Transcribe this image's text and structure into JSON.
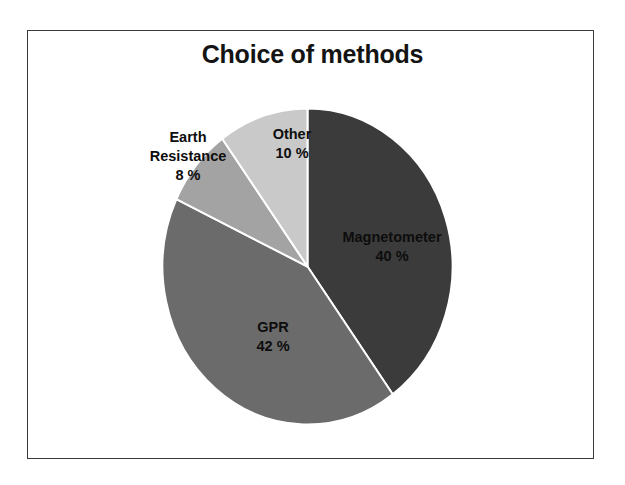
{
  "figure": {
    "title": "Choice of methods",
    "background_color": "#ffffff",
    "border_color": "#3a3a3a",
    "label_text_color": "#0d0d0d"
  },
  "chart_data": {
    "type": "pie",
    "title": "Choice of methods",
    "xlabel": "",
    "ylabel": "",
    "unit": "%",
    "legend": "none",
    "grid": false,
    "start_angle_deg": 0,
    "direction": "clockwise",
    "categories": [
      "Magnetometer",
      "GPR",
      "Earth Resistance",
      "Other"
    ],
    "values": [
      40,
      42,
      8,
      10
    ],
    "colors": [
      "#3b3b3b",
      "#6b6b6b",
      "#a3a3a3",
      "#c9c9c9"
    ],
    "slices": [
      {
        "label": "Magnetometer",
        "value": 40,
        "value_text": "40 %",
        "color": "#3b3b3b",
        "label_position": "inside"
      },
      {
        "label": "GPR",
        "value": 42,
        "value_text": "42 %",
        "color": "#6b6b6b",
        "label_position": "inside"
      },
      {
        "label": "Earth Resistance",
        "label_line1": "Earth",
        "label_line2": "Resistance",
        "value": 8,
        "value_text": "8 %",
        "color": "#a3a3a3",
        "label_position": "outside"
      },
      {
        "label": "Other",
        "value": 10,
        "value_text": "10 %",
        "color": "#c9c9c9",
        "label_position": "inside"
      }
    ]
  }
}
